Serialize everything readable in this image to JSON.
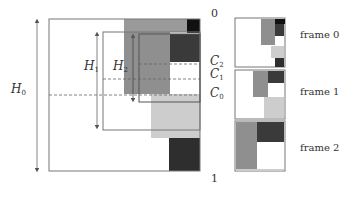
{
  "diagram": {
    "colors": {
      "black": "#111111",
      "dark_gray": "#3a3a3a",
      "mid_gray": "#8f8f8f",
      "light_gray": "#cdcdcd",
      "outline": "#777777",
      "dashed": "#666666"
    },
    "axis_labels": {
      "top": "0",
      "bottom": "1"
    },
    "height_labels": {
      "h0": {
        "symbol": "H",
        "sub": "0"
      },
      "h1": {
        "symbol": "H",
        "sub": "1"
      },
      "h2": {
        "symbol": "H",
        "sub": "2"
      }
    },
    "cut_labels": {
      "c2": {
        "symbol": "C",
        "sub": "2"
      },
      "c1": {
        "symbol": "C",
        "sub": "1"
      },
      "c0": {
        "symbol": "C",
        "sub": "0"
      }
    },
    "frames": [
      {
        "label": "frame 0"
      },
      {
        "label": "frame 1"
      },
      {
        "label": "frame 2"
      }
    ]
  }
}
